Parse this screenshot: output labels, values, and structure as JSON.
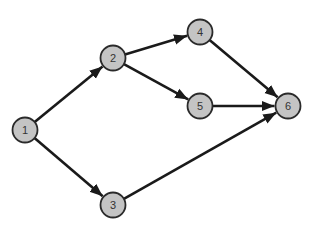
{
  "diagram": {
    "type": "directed-graph",
    "colors": {
      "node_fill": "#c4c4c4",
      "node_stroke": "#2a2a2a",
      "edge": "#1a1a1a",
      "background": "#ffffff"
    },
    "nodes": [
      {
        "id": "1",
        "label": "1",
        "x": 25,
        "y": 130
      },
      {
        "id": "2",
        "label": "2",
        "x": 113,
        "y": 58
      },
      {
        "id": "3",
        "label": "3",
        "x": 113,
        "y": 205
      },
      {
        "id": "4",
        "label": "4",
        "x": 200,
        "y": 32
      },
      {
        "id": "5",
        "label": "5",
        "x": 200,
        "y": 106
      },
      {
        "id": "6",
        "label": "6",
        "x": 288,
        "y": 106
      }
    ],
    "edges": [
      {
        "from": "1",
        "to": "2"
      },
      {
        "from": "1",
        "to": "3"
      },
      {
        "from": "2",
        "to": "4"
      },
      {
        "from": "2",
        "to": "5"
      },
      {
        "from": "4",
        "to": "6"
      },
      {
        "from": "5",
        "to": "6"
      },
      {
        "from": "3",
        "to": "6"
      }
    ]
  }
}
